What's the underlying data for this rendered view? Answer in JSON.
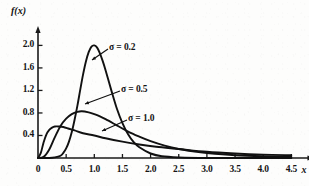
{
  "chart_data": {
    "type": "line",
    "title": "",
    "subtitle": "",
    "xlabel": "x",
    "ylabel": "f(x)",
    "xlim": [
      0,
      4.75
    ],
    "ylim": [
      0,
      2.15
    ],
    "xticks": [
      "0",
      "0.5",
      "1.0",
      "1.5",
      "2.0",
      "2.5",
      "3.0",
      "3.5",
      "4.0",
      "4.5"
    ],
    "xtick_values": [
      0,
      0.5,
      1.0,
      1.5,
      2.0,
      2.5,
      3.0,
      3.5,
      4.0,
      4.5
    ],
    "yticks": [
      "0.4",
      "0.8",
      "1.2",
      "1.6",
      "2.0"
    ],
    "ytick_values": [
      0.4,
      0.8,
      1.2,
      1.6,
      2.0
    ],
    "grid": false,
    "legend_position": "inline-annotations",
    "line_color": "#111111",
    "axis_color": "#1a1a1a",
    "series": [
      {
        "name": "sigma = 0.2",
        "label": "σ = 0.2",
        "sigma": 0.2,
        "peak_x": 0.96,
        "peak_y": 2.0,
        "x": [
          0.0,
          0.2,
          0.3,
          0.4,
          0.45,
          0.5,
          0.55,
          0.6,
          0.65,
          0.7,
          0.75,
          0.8,
          0.85,
          0.9,
          0.95,
          1.0,
          1.05,
          1.1,
          1.15,
          1.2,
          1.3,
          1.4,
          1.5,
          1.6,
          1.7,
          1.8,
          2.0,
          2.2,
          2.5,
          3.0,
          3.5,
          4.0,
          4.5
        ],
        "y": [
          0.0,
          0.0,
          0.01,
          0.04,
          0.09,
          0.17,
          0.29,
          0.46,
          0.68,
          0.93,
          1.21,
          1.48,
          1.71,
          1.88,
          1.98,
          2.0,
          1.96,
          1.86,
          1.72,
          1.56,
          1.21,
          0.88,
          0.62,
          0.42,
          0.28,
          0.19,
          0.08,
          0.03,
          0.01,
          0.0,
          0.0,
          0.0,
          0.0
        ]
      },
      {
        "name": "sigma = 0.5",
        "label": "σ = 0.5",
        "sigma": 0.5,
        "peak_x": 0.78,
        "peak_y": 0.83,
        "x": [
          0.0,
          0.1,
          0.2,
          0.3,
          0.4,
          0.5,
          0.6,
          0.7,
          0.78,
          0.9,
          1.0,
          1.1,
          1.2,
          1.4,
          1.6,
          1.8,
          2.0,
          2.25,
          2.5,
          2.75,
          3.0,
          3.5,
          4.0,
          4.5
        ],
        "y": [
          0.0,
          0.02,
          0.15,
          0.37,
          0.57,
          0.7,
          0.78,
          0.82,
          0.83,
          0.81,
          0.78,
          0.74,
          0.69,
          0.58,
          0.47,
          0.38,
          0.3,
          0.22,
          0.16,
          0.12,
          0.09,
          0.05,
          0.03,
          0.02
        ]
      },
      {
        "name": "sigma = 1.0",
        "label": "σ = 1.0",
        "sigma": 1.0,
        "peak_x": 0.37,
        "peak_y": 0.56,
        "x": [
          0.0,
          0.05,
          0.1,
          0.15,
          0.2,
          0.25,
          0.3,
          0.37,
          0.45,
          0.55,
          0.65,
          0.8,
          1.0,
          1.2,
          1.5,
          1.8,
          2.1,
          2.5,
          3.0,
          3.5,
          4.0,
          4.5
        ],
        "y": [
          0.0,
          0.09,
          0.28,
          0.42,
          0.5,
          0.54,
          0.56,
          0.56,
          0.55,
          0.52,
          0.49,
          0.44,
          0.4,
          0.35,
          0.29,
          0.24,
          0.2,
          0.16,
          0.11,
          0.08,
          0.06,
          0.05
        ]
      }
    ],
    "annotations": [
      {
        "label": "σ = 0.2",
        "text_x": 109,
        "text_y": 42,
        "leader_from_x": 108,
        "leader_from_y": 49,
        "leader_to_x": 92,
        "leader_to_y": 60
      },
      {
        "label": "σ = 0.5",
        "text_x": 121,
        "text_y": 84,
        "leader_from_x": 120,
        "leader_from_y": 91,
        "leader_to_x": 85,
        "leader_to_y": 104
      },
      {
        "label": "σ = 1.0",
        "text_x": 128,
        "text_y": 113,
        "leader_from_x": 127,
        "leader_from_y": 120,
        "leader_to_x": 102,
        "leader_to_y": 131
      }
    ]
  }
}
